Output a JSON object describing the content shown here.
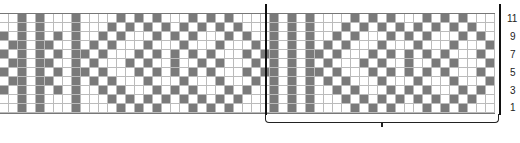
{
  "chart": {
    "rows": 11,
    "cell_size_px": 9,
    "colors": {
      "contrast": "#7a7a7a",
      "background": "#ffffff",
      "grid": "#bbbbbb"
    },
    "row_labels": [
      "11",
      "9",
      "7",
      "5",
      "3",
      "1"
    ],
    "bracket_label": "",
    "edge_pattern": [
      "0010100",
      "0010100",
      "1010101",
      "0110110",
      "1010101",
      "0110110",
      "1010101",
      "0110110",
      "1010101",
      "0010100",
      "0010100"
    ],
    "repeat_pattern": [
      "01000010101000101010000101",
      "01000101010101010101000101",
      "01001010001010100010100101",
      "01010100010001000100010101",
      "01101000101010101000101101",
      "01010001010010010100010101",
      "01101000101010101000101101",
      "01010100010001000100010101",
      "01001010001010100010100101",
      "01000101010101010101000101",
      "01000010101000101010000101"
    ],
    "left_repeat_count": 1,
    "right_repeat_count": 1
  }
}
